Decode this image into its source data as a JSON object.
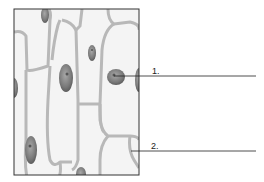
{
  "diagram": {
    "labels": [
      {
        "id": "1",
        "text": "1.",
        "points_to": "nucleus"
      },
      {
        "id": "2",
        "text": "2.",
        "points_to": "cell wall"
      }
    ],
    "colors": {
      "background": "#ffffff",
      "cell_fill": "#f2f2f2",
      "cell_wall": "#b4b4b4",
      "nucleus": "#8a8a8a",
      "frame": "#333333",
      "leader_line": "#222222"
    }
  }
}
